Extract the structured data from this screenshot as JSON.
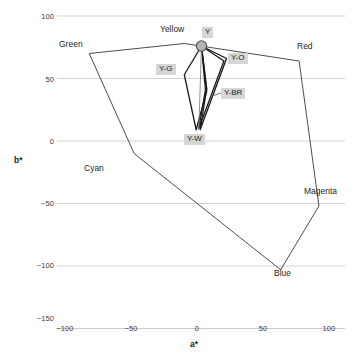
{
  "chart_data": {
    "type": "scatter",
    "title": "",
    "xlabel": "a*",
    "ylabel": "b*",
    "xlim": [
      -115,
      107
    ],
    "ylim": [
      -160,
      112
    ],
    "xticks": [
      -100,
      -50,
      0,
      50,
      100
    ],
    "xticklabels": [
      "−100",
      "−50",
      "0",
      "50",
      "100"
    ],
    "yticks": [
      100,
      50,
      0,
      -50,
      -100,
      -150
    ],
    "yticklabels": [
      "100",
      "50",
      "0",
      "−50",
      "−100",
      "−150"
    ],
    "grid": true,
    "grid_axis": "y",
    "legend": "none",
    "series": [
      {
        "name": "sRGB gamut boundary",
        "type": "polygon",
        "closed": true,
        "color": "#4d4d4d",
        "points": [
          {
            "label": "Yellow",
            "a": -10,
            "b": 78
          },
          {
            "label": "Red",
            "a": 77,
            "b": 64
          },
          {
            "label": "Magenta",
            "a": 92,
            "b": -52
          },
          {
            "label": "Blue",
            "a": 63,
            "b": -103
          },
          {
            "label": "Cyan",
            "a": -48,
            "b": -10
          },
          {
            "label": "Green",
            "a": -82,
            "b": 70
          }
        ]
      },
      {
        "name": "Y-G lobe",
        "type": "polygon",
        "closed": true,
        "color": "#1a1a1a",
        "points": [
          {
            "a": 3,
            "b": 76
          },
          {
            "a": -10,
            "b": 53
          },
          {
            "a": -1,
            "b": 9
          },
          {
            "a": 7,
            "b": 40
          }
        ]
      },
      {
        "name": "Y-O lobe",
        "type": "polygon",
        "closed": true,
        "color": "#1a1a1a",
        "points": [
          {
            "a": 3,
            "b": 76
          },
          {
            "a": 22,
            "b": 66
          },
          {
            "a": 2,
            "b": 9
          },
          {
            "a": 7,
            "b": 42
          }
        ]
      },
      {
        "name": "Y-BR trace",
        "type": "polygon",
        "closed": true,
        "color": "#1a1a1a",
        "points": [
          {
            "a": 3,
            "b": 76
          },
          {
            "a": 20,
            "b": 64
          },
          {
            "a": 1,
            "b": 10
          },
          {
            "a": 6,
            "b": 41
          }
        ]
      },
      {
        "name": "Y-W trace",
        "type": "line",
        "closed": false,
        "color": "#777777",
        "points": [
          {
            "a": 3,
            "b": 76
          },
          {
            "a": 1,
            "b": 9
          }
        ]
      }
    ],
    "markers": [
      {
        "label": "Y",
        "a": 3,
        "b": 76,
        "fill": "#b3b3b3",
        "stroke": "#4d4d4d",
        "radius": 5.2
      }
    ],
    "annotations": [
      {
        "name": "Y",
        "text": "Y",
        "kind": "sample",
        "a": 3,
        "b": 76
      },
      {
        "name": "Y-G",
        "text": "Y-G",
        "kind": "sample",
        "a": -10,
        "b": 53
      },
      {
        "name": "Y-O",
        "text": "Y-O",
        "kind": "sample",
        "a": 22,
        "b": 66
      },
      {
        "name": "Y-BR",
        "text": "Y-BR",
        "kind": "sample",
        "a": 20,
        "b": 41
      },
      {
        "name": "Y-W",
        "text": "Y-W",
        "kind": "sample",
        "a": 1,
        "b": 2
      },
      {
        "name": "Yellow",
        "text": "Yellow",
        "kind": "gamut",
        "a": -10,
        "b": 78
      },
      {
        "name": "Green",
        "text": "Green",
        "kind": "gamut",
        "a": -82,
        "b": 70
      },
      {
        "name": "Red",
        "text": "Red",
        "kind": "gamut",
        "a": 77,
        "b": 64
      },
      {
        "name": "Cyan",
        "text": "Cyan",
        "kind": "gamut",
        "a": -48,
        "b": -10
      },
      {
        "name": "Magenta",
        "text": "Magenta",
        "kind": "gamut",
        "a": 92,
        "b": -52
      },
      {
        "name": "Blue",
        "text": "Blue",
        "kind": "gamut",
        "a": 63,
        "b": -103
      }
    ],
    "colors": {
      "gamut_line": "#4d4d4d",
      "sample_line": "#1a1a1a",
      "gridline": "#c9c9c9",
      "axis_text": "#3a3a3a",
      "label_background": "#d6d6d6",
      "marker_fill": "#b3b3b3"
    }
  },
  "axes": {
    "x_title": "a*",
    "y_title": "b*",
    "x_tick_labels": [
      "−100",
      "−50",
      "0",
      "50",
      "100"
    ],
    "y_tick_labels": [
      "100",
      "50",
      "0",
      "−50",
      "−100",
      "−150"
    ]
  },
  "gamut_labels": {
    "yellow": "Yellow",
    "green": "Green",
    "red": "Red",
    "cyan": "Cyan",
    "magenta": "Magenta",
    "blue": "Blue"
  },
  "sample_labels": {
    "y": "Y",
    "y_g": "Y-G",
    "y_o": "Y-O",
    "y_br": "Y-BR",
    "y_w": "Y-W"
  }
}
